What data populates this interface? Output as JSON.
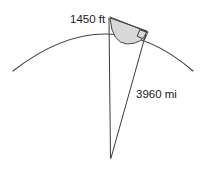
{
  "figure": {
    "background_color": "#ffffff",
    "line_color": "#3a3a3a",
    "arc_color": "#444444",
    "shaded_region_color": "#d8d8d8",
    "labels": {
      "height_label": "1450 ft",
      "radius_label": "3960 mi"
    },
    "geometry": {
      "earth_arc": {
        "name": "earth-surface-arc",
        "start": [
          13,
          70
        ],
        "apex": [
          108,
          21
        ],
        "end": [
          193,
          70
        ]
      },
      "vertical_radius": {
        "name": "vertical-radius-line",
        "from": [
          109,
          19
        ],
        "to": [
          110,
          158
        ]
      },
      "tangent_line": {
        "name": "tangent-line",
        "from": [
          110,
          17
        ],
        "to": [
          147,
          32
        ]
      },
      "slant_radius": {
        "name": "slant-radius-line",
        "from": [
          145,
          34
        ],
        "to": [
          110,
          158
        ]
      },
      "tangent_point": [
        145,
        33
      ],
      "observer_point": [
        110,
        17
      ],
      "center_point": [
        110,
        158
      ],
      "right_angle_marker": {
        "name": "right-angle-marker",
        "at": [
          145,
          33
        ],
        "size": 9
      },
      "shaded_sector": {
        "name": "shaded-sector",
        "vertices": [
          [
            110,
            17
          ],
          [
            147,
            32
          ]
        ],
        "arc_through": [
          124,
          38
        ]
      }
    }
  }
}
